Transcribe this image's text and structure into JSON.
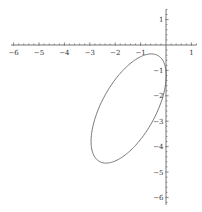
{
  "chart_data": {
    "type": "line",
    "subtype": "parametric-curve",
    "title": "",
    "xlabel": "",
    "ylabel": "",
    "xlim": [
      -6.1,
      1.2
    ],
    "ylim": [
      -6.3,
      1.4
    ],
    "grid": false,
    "legend": null,
    "axes_origin": [
      0,
      0
    ],
    "x_ticks": [
      -6,
      -5,
      -4,
      -3,
      -2,
      -1,
      1
    ],
    "y_ticks": [
      1,
      -1,
      -2,
      -3,
      -4,
      -5,
      -6
    ],
    "x_tick_labels": [
      "-6",
      "-5",
      "-4",
      "-3",
      "-2",
      "-1",
      "1"
    ],
    "y_tick_labels": [
      "1",
      "-1",
      "-2",
      "-3",
      "-4",
      "-5",
      "-6"
    ],
    "minor_ticks_per_unit": 5,
    "series": [
      {
        "name": "ellipse",
        "description": "closed tilted ellipse centered near (-1.47, -2.5)",
        "center": [
          -1.47,
          -2.5
        ],
        "x_amplitude": 1.48,
        "y_amplitude": 2.15,
        "phase_deg": 53,
        "key_points": {
          "top": [
            -0.43,
            -0.35
          ],
          "bottom": [
            -2.48,
            -4.65
          ],
          "leftmost": [
            -2.95,
            -4.06
          ],
          "rightmost": [
            0.01,
            -1.2
          ]
        },
        "color": "#666666"
      }
    ]
  },
  "layout": {
    "origin_px": [
      166,
      45
    ],
    "unit_px": 25.4
  }
}
